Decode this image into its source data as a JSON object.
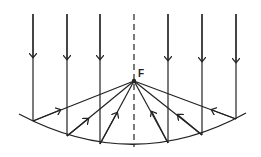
{
  "diagram": {
    "title": "",
    "focus_label": "F",
    "focus": {
      "x": 134,
      "y": 81
    },
    "axis": {
      "x": 134,
      "y_top": 14,
      "y_bottom": 147,
      "style": "dashed"
    },
    "mirror": {
      "left": {
        "x": 19,
        "y": 114
      },
      "bottom": {
        "x": 134,
        "y": 147
      },
      "right": {
        "x": 246,
        "y": 113
      }
    },
    "incident_rays": [
      {
        "x": 33,
        "y_top": 14,
        "y_hit": 121
      },
      {
        "x": 67,
        "y_top": 14,
        "y_hit": 136
      },
      {
        "x": 100,
        "y_top": 14,
        "y_hit": 144
      },
      {
        "x": 168,
        "y_top": 14,
        "y_hit": 143
      },
      {
        "x": 202,
        "y_top": 14,
        "y_hit": 135
      },
      {
        "x": 236,
        "y_top": 14,
        "y_hit": 119
      }
    ],
    "colors": {
      "stroke": "#222222",
      "background": "#ffffff"
    }
  }
}
